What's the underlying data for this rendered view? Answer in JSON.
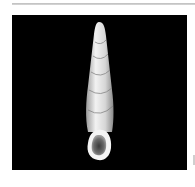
{
  "image": {
    "subject": "elongated turreted snail shell on black background",
    "colors": {
      "background": "#000000",
      "frame": "#ffffff",
      "shell_light": "#e8e8e8",
      "shell_mid": "#b8b8b8",
      "top_rule": "#c8c8c8"
    }
  }
}
